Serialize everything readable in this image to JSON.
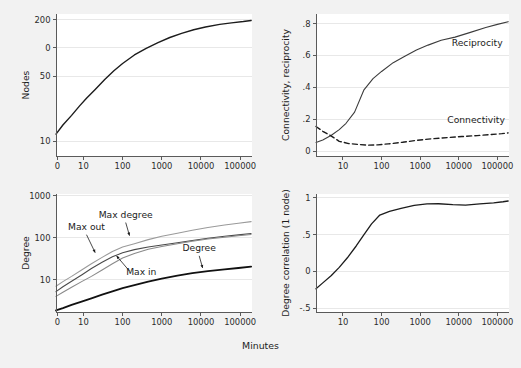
{
  "figure": {
    "shared_xlabel": "Minutes",
    "background_color": "#f2f2f2",
    "plot_color": "#ffffff",
    "axis_color": "#5a5a5a",
    "grid_color": "#e8e8e8"
  },
  "chart_data": [
    {
      "id": "nodes",
      "type": "line",
      "title": "",
      "xlabel": "",
      "ylabel": "Nodes",
      "xscale": "log",
      "yscale": "log",
      "xlim": [
        2,
        200000
      ],
      "ylim": [
        7,
        230
      ],
      "xticks": [
        1,
        10,
        100,
        1000,
        10000,
        100000
      ],
      "xticklabels": [
        "0",
        "10",
        "100",
        "1000",
        "10000",
        "100000"
      ],
      "yticks": [
        10,
        50,
        100,
        200
      ],
      "yticklabels": [
        "10",
        "50",
        "0",
        "200"
      ],
      "grid": true,
      "legend": "none",
      "series": [
        {
          "name": "Nodes",
          "color": "#1c1c1c",
          "width": 1.4,
          "dash": "none",
          "x": [
            2,
            3,
            5,
            8,
            12,
            20,
            35,
            60,
            100,
            200,
            400,
            800,
            1600,
            3200,
            6500,
            13000,
            30000,
            60000,
            120000,
            190000
          ],
          "y": [
            12,
            15,
            19,
            24,
            29,
            36,
            46,
            57,
            68,
            84,
            99,
            114,
            129,
            143,
            156,
            167,
            178,
            185,
            191,
            196
          ]
        }
      ]
    },
    {
      "id": "connectivity-reciprocity",
      "type": "line",
      "title": "",
      "xlabel": "",
      "ylabel": "Connectivity, reciprocity",
      "xscale": "log",
      "yscale": "linear",
      "xlim": [
        2,
        200000
      ],
      "ylim": [
        -0.03,
        0.86
      ],
      "xticks": [
        10,
        100,
        1000,
        10000,
        100000
      ],
      "xticklabels": [
        "10",
        "100",
        "1000",
        "10000",
        "100000"
      ],
      "yticks": [
        0,
        0.2,
        0.4,
        0.6,
        0.8
      ],
      "yticklabels": [
        "0",
        ".2",
        ".4",
        ".6",
        ".8"
      ],
      "grid": true,
      "legend": "inline",
      "series": [
        {
          "name": "Reciprocity",
          "color": "#3c3c3c",
          "width": 1.1,
          "dash": "none",
          "label_x": 30000,
          "label_y": 0.66,
          "x": [
            2,
            3,
            5,
            8,
            12,
            20,
            35,
            60,
            100,
            200,
            400,
            800,
            1600,
            3500,
            8000,
            20000,
            50000,
            100000,
            190000
          ],
          "y": [
            0.055,
            0.07,
            0.1,
            0.135,
            0.175,
            0.245,
            0.385,
            0.455,
            0.5,
            0.555,
            0.595,
            0.635,
            0.665,
            0.695,
            0.715,
            0.745,
            0.775,
            0.795,
            0.812
          ]
        },
        {
          "name": "Connectivity",
          "color": "#1c1c1c",
          "width": 1.4,
          "dash": "dashed",
          "label_x": 28000,
          "label_y": 0.175,
          "x": [
            2,
            3,
            5,
            8,
            14,
            25,
            45,
            80,
            150,
            350,
            800,
            2000,
            5000,
            12000,
            30000,
            70000,
            130000,
            190000
          ],
          "y": [
            0.155,
            0.125,
            0.095,
            0.062,
            0.048,
            0.042,
            0.038,
            0.04,
            0.046,
            0.056,
            0.068,
            0.078,
            0.085,
            0.092,
            0.098,
            0.105,
            0.11,
            0.115
          ]
        }
      ]
    },
    {
      "id": "degree",
      "type": "line",
      "title": "",
      "xlabel": "",
      "ylabel": "Degree",
      "xscale": "log",
      "yscale": "log",
      "xlim": [
        2,
        200000
      ],
      "ylim": [
        1.7,
        1100
      ],
      "xticks": [
        1,
        10,
        100,
        1000,
        10000,
        100000
      ],
      "xticklabels": [
        "0",
        "10",
        "100",
        "1000",
        "10000",
        "100000"
      ],
      "yticks": [
        10,
        100,
        1000
      ],
      "yticklabels": [
        "10",
        "100",
        "1000"
      ],
      "grid": true,
      "legend": "inline",
      "series": [
        {
          "name": "Max degree",
          "color": "#9a9a9a",
          "width": 1.1,
          "dash": "none",
          "label_x": 120,
          "label_y": 300,
          "x": [
            2,
            3,
            5,
            9,
            16,
            30,
            55,
            100,
            200,
            450,
            1000,
            2500,
            6000,
            15000,
            40000,
            90000,
            190000
          ],
          "y": [
            7.0,
            9.0,
            12.0,
            17.0,
            24.0,
            34.0,
            47.0,
            60.0,
            72.0,
            90.0,
            108.0,
            128.0,
            150.0,
            175.0,
            200.0,
            222.0,
            242.0
          ]
        },
        {
          "name": "Max out",
          "color": "#4a4a4a",
          "width": 1.1,
          "dash": "none",
          "label_x": 12,
          "label_y": 150,
          "x": [
            2,
            3,
            5,
            9,
            16,
            30,
            55,
            100,
            200,
            450,
            1000,
            2500,
            6000,
            15000,
            40000,
            90000,
            190000
          ],
          "y": [
            5.2,
            6.8,
            9.2,
            13.0,
            18.5,
            26.0,
            35.0,
            44.0,
            52.0,
            60.0,
            67.0,
            76.0,
            86.0,
            97.0,
            108.0,
            117.0,
            126.0
          ]
        },
        {
          "name": "Max in",
          "color": "#8a8a8a",
          "width": 1.1,
          "dash": "none",
          "label_x": 300,
          "label_y": 13,
          "x": [
            2,
            3,
            5,
            9,
            16,
            30,
            55,
            100,
            200,
            450,
            1000,
            2500,
            6000,
            15000,
            40000,
            90000,
            190000
          ],
          "y": [
            4.0,
            5.0,
            6.6,
            9.0,
            12.0,
            17.0,
            24.0,
            33.0,
            42.0,
            53.0,
            62.0,
            72.0,
            82.0,
            93.0,
            103.0,
            111.0,
            119.0
          ]
        },
        {
          "name": "Degree",
          "color": "#111111",
          "width": 1.8,
          "dash": "none",
          "label_x": 9000,
          "label_y": 47,
          "x": [
            2,
            3,
            5,
            9,
            16,
            30,
            55,
            100,
            200,
            450,
            1000,
            2500,
            6000,
            15000,
            40000,
            90000,
            190000
          ],
          "y": [
            1.85,
            2.1,
            2.5,
            3.0,
            3.6,
            4.4,
            5.3,
            6.3,
            7.4,
            9.0,
            10.6,
            12.5,
            14.3,
            16.0,
            17.6,
            19.0,
            20.5
          ]
        }
      ]
    },
    {
      "id": "degree-correlation",
      "type": "line",
      "title": "",
      "xlabel": "",
      "ylabel": "Degree correlation (1 node)",
      "xscale": "log",
      "yscale": "linear",
      "xlim": [
        2,
        200000
      ],
      "ylim": [
        -0.55,
        1.05
      ],
      "xticks": [
        10,
        100,
        1000,
        10000,
        100000
      ],
      "xticklabels": [
        "10",
        "100",
        "1000",
        "10000",
        "100000"
      ],
      "yticks": [
        -0.5,
        0,
        0.5,
        1
      ],
      "yticklabels": [
        "-.5",
        "0",
        ".5",
        "1"
      ],
      "grid": true,
      "legend": "none",
      "series": [
        {
          "name": "Degree correlation",
          "color": "#1c1c1c",
          "width": 1.3,
          "dash": "none",
          "x": [
            2,
            3,
            5,
            8,
            13,
            22,
            35,
            55,
            90,
            160,
            320,
            700,
            1500,
            3000,
            7000,
            15000,
            35000,
            80000,
            140000,
            190000
          ],
          "y": [
            -0.235,
            -0.155,
            -0.055,
            0.055,
            0.185,
            0.345,
            0.5,
            0.645,
            0.765,
            0.815,
            0.855,
            0.895,
            0.915,
            0.918,
            0.905,
            0.898,
            0.915,
            0.93,
            0.945,
            0.955
          ]
        }
      ]
    }
  ],
  "panels": {
    "nodes": {
      "left": 4,
      "top": 4,
      "width": 256,
      "height": 180
    },
    "connectivity": {
      "left": 264,
      "top": 4,
      "width": 253,
      "height": 180
    },
    "degree": {
      "left": 4,
      "top": 184,
      "width": 256,
      "height": 156
    },
    "correlation": {
      "left": 264,
      "top": 184,
      "width": 253,
      "height": 156
    }
  }
}
